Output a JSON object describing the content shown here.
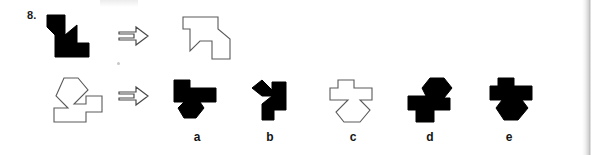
{
  "item": {
    "number": "8.",
    "type": "spatial-reasoning-paper-folding",
    "background_color": "#ffffff",
    "fill_color": "#000000",
    "outline_color": "#555555"
  },
  "prompt_row": {
    "stimulus_name": "black-boot-shape",
    "arrow_glyph": "⇒",
    "target_name": "target-outline-shape"
  },
  "second_row": {
    "stimulus_name": "outline-arrow-block-shape",
    "arrow_glyph": "⇒"
  },
  "options": [
    {
      "key": "a",
      "label": "a",
      "style": "filled",
      "name": "option-a-shape"
    },
    {
      "key": "b",
      "label": "b",
      "style": "filled",
      "name": "option-b-shape"
    },
    {
      "key": "c",
      "label": "c",
      "style": "outline",
      "name": "option-c-shape"
    },
    {
      "key": "d",
      "label": "d",
      "style": "filled",
      "name": "option-d-shape"
    },
    {
      "key": "e",
      "label": "e",
      "style": "filled",
      "name": "option-e-shape"
    }
  ]
}
